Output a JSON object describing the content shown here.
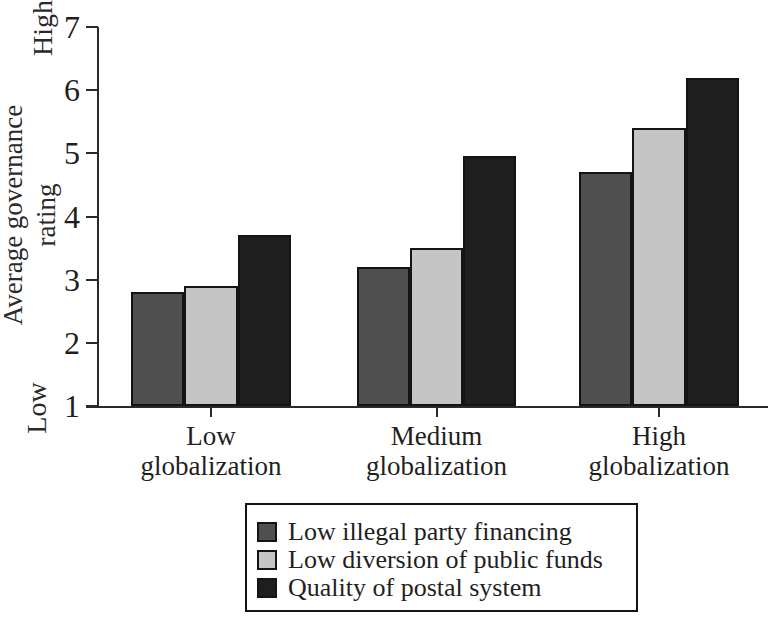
{
  "chart_data": {
    "type": "bar",
    "title": "",
    "xlabel": "",
    "ylabel": "Average governance rating",
    "ylabel_lines": [
      "Average governance",
      "rating"
    ],
    "axis_end_labels": {
      "top": "High",
      "bottom": "Low"
    },
    "ylim": [
      1,
      7
    ],
    "y_ticks": [
      1,
      2,
      3,
      4,
      5,
      6,
      7
    ],
    "grid": false,
    "legend_position": "bottom",
    "categories": [
      "Low globalization",
      "Medium globalization",
      "High globalization"
    ],
    "category_label_lines": [
      [
        "Low",
        "globalization"
      ],
      [
        "Medium",
        "globalization"
      ],
      [
        "High",
        "globalization"
      ]
    ],
    "series": [
      {
        "name": "Low illegal party financing",
        "color": "#4f4f4f",
        "values": [
          2.8,
          3.2,
          4.7
        ]
      },
      {
        "name": "Low diversion of public funds",
        "color": "#c5c5c5",
        "values": [
          2.9,
          3.5,
          5.4
        ]
      },
      {
        "name": "Quality of postal system",
        "color": "#1e1e1e",
        "values": [
          3.7,
          4.95,
          6.2
        ]
      }
    ],
    "colors": {
      "axis": "#2a2a2a",
      "text": "#1f1f1f",
      "background": "#ffffff",
      "bar_border": "#141414"
    }
  }
}
